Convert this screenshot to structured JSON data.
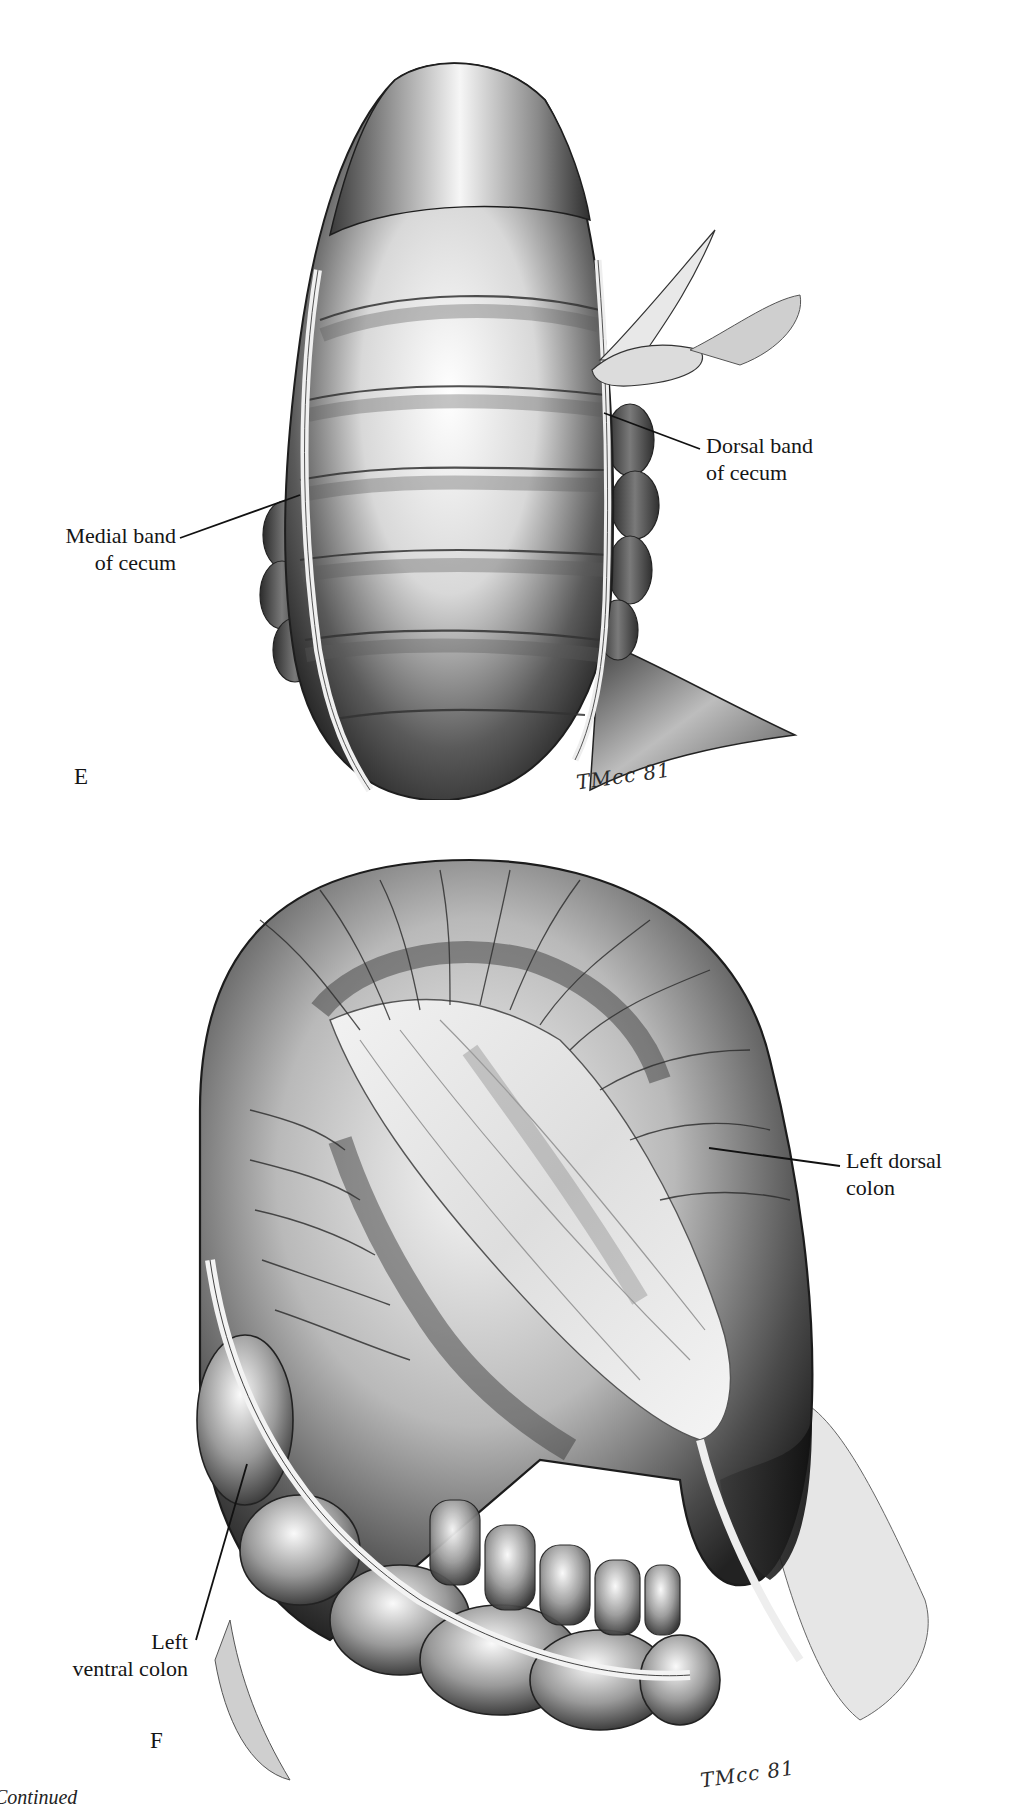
{
  "figure_e": {
    "panel_letter": "E",
    "labels": {
      "dorsal_band": [
        "Dorsal band",
        "of cecum"
      ],
      "medial_band": [
        "Medial band",
        "of cecum"
      ]
    },
    "signature": "TMcc 81"
  },
  "figure_f": {
    "panel_letter": "F",
    "labels": {
      "left_dorsal_colon": [
        "Left dorsal",
        "colon"
      ],
      "left_ventral_colon": [
        "Left",
        "ventral colon"
      ]
    },
    "signature": "TMcc 81"
  },
  "footer": {
    "continued_text": "Continued"
  },
  "colors": {
    "ink": "#151515",
    "shadow": "#3a3a3a",
    "midtone": "#8a8a8a",
    "highlight": "#f4f4f4",
    "background": "#ffffff"
  }
}
